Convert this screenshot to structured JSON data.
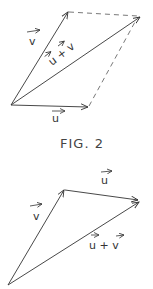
{
  "figure_top": {
    "type": "parallelogram-vector-addition",
    "labels": {
      "v": "v",
      "u": "u",
      "sum": "u + v"
    },
    "caption": "FIG. 2"
  },
  "figure_bottom": {
    "type": "triangle-vector-addition",
    "labels": {
      "v": "v",
      "u": "u",
      "sum": "u + v"
    }
  },
  "colors": {
    "ink": "#333333",
    "background": "#ffffff"
  }
}
